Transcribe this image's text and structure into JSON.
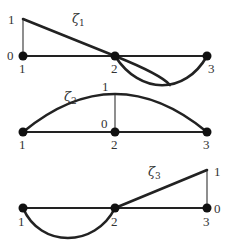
{
  "diagram": {
    "panels": [
      {
        "name": "zeta-1",
        "function_symbol": "ζ",
        "function_index": "1",
        "node_labels": [
          "1",
          "2",
          "3"
        ],
        "value_high_label": "1",
        "value_low_label": "0",
        "peak_node": "1"
      },
      {
        "name": "zeta-2",
        "function_symbol": "ζ",
        "function_index": "2",
        "node_labels": [
          "1",
          "2",
          "3"
        ],
        "value_high_label": "1",
        "value_low_label": "0",
        "peak_node": "2"
      },
      {
        "name": "zeta-3",
        "function_symbol": "ζ",
        "function_index": "3",
        "node_labels": [
          "1",
          "2",
          "3"
        ],
        "value_high_label": "1",
        "value_low_label": "0",
        "peak_node": "3"
      }
    ],
    "colors": {
      "line": "#222222",
      "node": "#111111",
      "text": "#333333",
      "background": "#ffffff"
    }
  }
}
